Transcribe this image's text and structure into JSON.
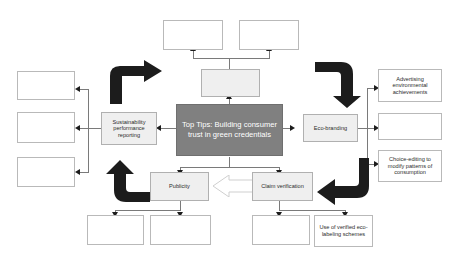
{
  "diagram": {
    "title_node": {
      "label": "Top Tips: Building consumer trust in green credentials"
    },
    "labeled_nodes": {
      "sustainability_reporting": "Sustainability performance reporting",
      "eco_branding": "Eco-branding",
      "publicity": "Publicity",
      "claim_verification": "Claim verification",
      "advertising_achievements": "Advertising environmental achievements",
      "choice_editing": "Choice-editing to modify patterns of consumption",
      "eco_labeling": "Use of verified eco-labeling schemes"
    },
    "blank_nodes": {
      "top_left": "",
      "top_right": "",
      "above_center": "",
      "left_one": "",
      "left_two": "",
      "left_three": "",
      "bottom_left_one": "",
      "bottom_left_two": "",
      "bottom_right_one": "",
      "right_middle": ""
    },
    "colors": {
      "center_fill": "#808080",
      "center_text": "#ffffff",
      "shaded_fill": "#efefef",
      "node_border": "#b9b9b9",
      "connector": "#7a7a7a",
      "bold_arrow": "#1c1c1c"
    }
  }
}
